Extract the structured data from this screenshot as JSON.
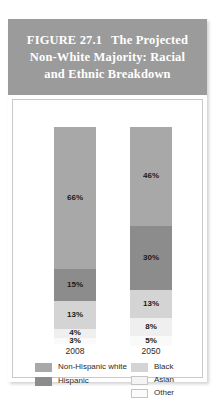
{
  "figure": {
    "label": "FIGURE 27.1",
    "title_line1": "The Projected",
    "title_line2": "Non-White Majority: Racial",
    "title_line3": "and Ethnic Breakdown"
  },
  "colors": {
    "header_background": "#9b9b9b",
    "non_hispanic_white": "#a8a8a8",
    "hispanic": "#8c8c8c",
    "black": "#d4d4d4",
    "asian": "#efefef",
    "other": "#fafafa"
  },
  "legend": {
    "left": [
      {
        "key": "non_hispanic_white",
        "label": "Non-Hispanic white"
      },
      {
        "key": "hispanic",
        "label": "Hispanic"
      }
    ],
    "right": [
      {
        "key": "black",
        "label": "Black"
      },
      {
        "key": "asian",
        "label": "Asian"
      },
      {
        "key": "other",
        "label": "Other"
      }
    ]
  },
  "bars": {
    "b2008": {
      "year": "2008",
      "segments": [
        {
          "key": "non_hispanic_white",
          "label": "66%",
          "value": 66
        },
        {
          "key": "hispanic",
          "label": "15%",
          "value": 15
        },
        {
          "key": "black",
          "label": "13%",
          "value": 13
        },
        {
          "key": "asian",
          "label": "4%",
          "value": 4
        },
        {
          "key": "other",
          "label": "3%",
          "value": 3
        }
      ]
    },
    "b2050": {
      "year": "2050",
      "segments": [
        {
          "key": "non_hispanic_white",
          "label": "46%",
          "value": 46
        },
        {
          "key": "hispanic",
          "label": "30%",
          "value": 30
        },
        {
          "key": "black",
          "label": "13%",
          "value": 13
        },
        {
          "key": "asian",
          "label": "8%",
          "value": 8
        },
        {
          "key": "other",
          "label": "5%",
          "value": 5
        }
      ]
    }
  },
  "chart_data": {
    "type": "bar",
    "subtype": "stacked-100-percent",
    "xlabel": "",
    "ylabel": "",
    "ylim": [
      0,
      100
    ],
    "grid": false,
    "legend_position": "bottom",
    "categories": [
      "2008",
      "2050"
    ],
    "series": [
      {
        "name": "Non-Hispanic white",
        "values": [
          66,
          46
        ],
        "color": "#a8a8a8"
      },
      {
        "name": "Hispanic",
        "values": [
          15,
          30
        ],
        "color": "#8c8c8c"
      },
      {
        "name": "Black",
        "values": [
          13,
          13
        ],
        "color": "#d4d4d4"
      },
      {
        "name": "Asian",
        "values": [
          4,
          8
        ],
        "color": "#efefef"
      },
      {
        "name": "Other",
        "values": [
          3,
          5
        ],
        "color": "#fafafa"
      }
    ],
    "data_labels": [
      [
        "66%",
        "15%",
        "13%",
        "4%",
        "3%"
      ],
      [
        "46%",
        "30%",
        "13%",
        "8%",
        "5%"
      ]
    ]
  }
}
